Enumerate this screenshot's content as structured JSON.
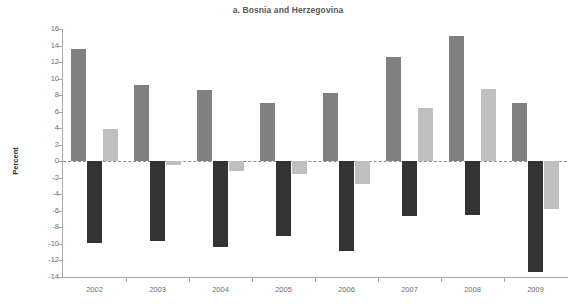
{
  "chart_data": {
    "type": "bar",
    "title": "a. Bosnia and Herzegovina",
    "xlabel": "",
    "ylabel": "Percent",
    "categories": [
      "2002",
      "2003",
      "2004",
      "2005",
      "2006",
      "2007",
      "2008",
      "2009"
    ],
    "ylim": [
      -14,
      16
    ],
    "yticks": [
      16,
      14,
      12,
      10,
      8,
      6,
      4,
      2,
      0,
      -2,
      -4,
      -6,
      -8,
      -10,
      -12,
      -14
    ],
    "ytick_labels": [
      "16",
      "14",
      "12",
      "10",
      "8",
      "6",
      "4",
      "2",
      "0",
      "-2",
      "-4",
      "-6",
      "-8",
      "-10",
      "-12",
      "-14"
    ],
    "grid": false,
    "legend": "none",
    "zero_line": 0,
    "series": [
      {
        "name": "series-1",
        "color": "#808080",
        "values": [
          13.6,
          9.2,
          8.6,
          7.1,
          8.2,
          12.6,
          15.1,
          7.0
        ]
      },
      {
        "name": "series-2",
        "color": "#333333",
        "values": [
          -9.9,
          -9.7,
          -10.4,
          -9.1,
          -10.8,
          -6.6,
          -6.5,
          -13.4
        ]
      },
      {
        "name": "series-3",
        "color": "#bfbfbf",
        "values": [
          3.9,
          -0.4,
          -1.2,
          -1.6,
          -2.8,
          6.4,
          8.8,
          -5.8
        ]
      }
    ]
  }
}
